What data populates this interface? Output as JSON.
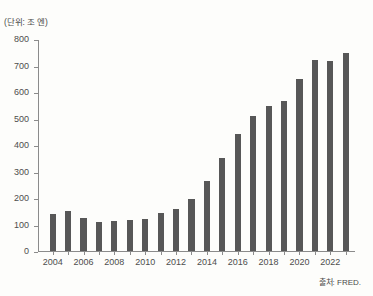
{
  "document": {
    "title_partial": "",
    "unit_label": "(단위: 조 엔)",
    "source_note": "출처: FRED."
  },
  "chart_data": {
    "type": "bar",
    "title": "",
    "subtitle": "",
    "xlabel": "",
    "ylabel": "(단위: 조 엔)",
    "unit": "조 엔",
    "ylim": [
      0,
      800
    ],
    "ytick_step": 100,
    "ytick_labels": [
      "0",
      "100",
      "200",
      "300",
      "400",
      "500",
      "600",
      "700",
      "800"
    ],
    "ytick_values": [
      0,
      100,
      200,
      300,
      400,
      500,
      600,
      700,
      800
    ],
    "xtick_labels": [
      "2004",
      "2006",
      "2008",
      "2010",
      "2012",
      "2014",
      "2016",
      "2018",
      "2020",
      "2022"
    ],
    "xtick_values": [
      2004,
      2006,
      2008,
      2010,
      2012,
      2014,
      2016,
      2018,
      2020,
      2022
    ],
    "grid": false,
    "legend": null,
    "bar_color": "#575757",
    "axis_color": "#8b8b8b",
    "categories": [
      "2004",
      "2005",
      "2006",
      "2007",
      "2008",
      "2009",
      "2010",
      "2011",
      "2012",
      "2013",
      "2014",
      "2015",
      "2016",
      "2017",
      "2018",
      "2019",
      "2020",
      "2021",
      "2022",
      "2023"
    ],
    "values": [
      140,
      152,
      126,
      108,
      112,
      118,
      122,
      145,
      160,
      196,
      265,
      350,
      440,
      510,
      546,
      566,
      650,
      720,
      718,
      748
    ],
    "source": "출처: FRED."
  }
}
